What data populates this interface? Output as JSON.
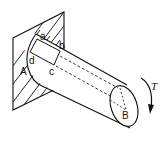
{
  "diagram": {
    "type": "torsion-shaft",
    "labels": {
      "a": "a",
      "b": "b",
      "c": "c",
      "d": "d",
      "A": "A",
      "B": "B",
      "T": "T"
    },
    "colors": {
      "stroke": "#111111",
      "background": "#ffffff"
    }
  }
}
